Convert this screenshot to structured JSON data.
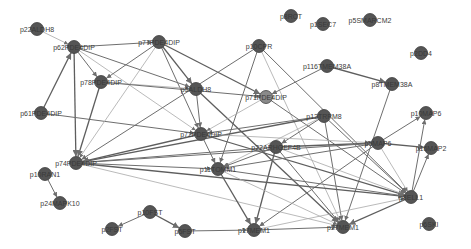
{
  "graph": {
    "type": "protein-interaction-network",
    "node_color": "#555555",
    "edge_color": "#6e6e6e",
    "background": "#ffffff",
    "nodes": [
      {
        "id": "n1",
        "label": "p22ALDH8",
        "x": 37,
        "y": 29
      },
      {
        "id": "n2",
        "label": "p62PDE4DIP",
        "x": 74,
        "y": 47
      },
      {
        "id": "n3",
        "label": "p77PDE4DIP",
        "x": 159,
        "y": 42
      },
      {
        "id": "n4",
        "label": "p10CPR",
        "x": 259,
        "y": 46
      },
      {
        "id": "n5",
        "label": "p8RCT",
        "x": 291,
        "y": 16
      },
      {
        "id": "n6",
        "label": "p1SEC7",
        "x": 323,
        "y": 24
      },
      {
        "id": "n7",
        "label": "p5SMARCM2",
        "x": 370,
        "y": 20
      },
      {
        "id": "n8",
        "label": "p2DD4",
        "x": 421,
        "y": 53
      },
      {
        "id": "n9",
        "label": "p116TMEM38A",
        "x": 327,
        "y": 66
      },
      {
        "id": "n10",
        "label": "p8TMEM38A",
        "x": 392,
        "y": 84
      },
      {
        "id": "n11",
        "label": "p78PDE4DIP",
        "x": 101,
        "y": 82
      },
      {
        "id": "n12",
        "label": "p5ALDH8",
        "x": 196,
        "y": 89
      },
      {
        "id": "n13",
        "label": "p71PDE4DIP",
        "x": 266,
        "y": 97
      },
      {
        "id": "n14",
        "label": "p61PDE4DIP",
        "x": 41,
        "y": 113
      },
      {
        "id": "n15",
        "label": "p12TRPM8",
        "x": 324,
        "y": 116
      },
      {
        "id": "n16",
        "label": "p10MAP6",
        "x": 426,
        "y": 113
      },
      {
        "id": "n17",
        "label": "p72PDE4DIP",
        "x": 201,
        "y": 134
      },
      {
        "id": "n18",
        "label": "p22ARHGEF4B",
        "x": 276,
        "y": 147
      },
      {
        "id": "n19",
        "label": "p5MAP6",
        "x": 378,
        "y": 143
      },
      {
        "id": "n20",
        "label": "p16MAP2",
        "x": 431,
        "y": 148
      },
      {
        "id": "n21",
        "label": "p74PDE4DIP",
        "x": 76,
        "y": 163
      },
      {
        "id": "n22",
        "label": "p10RAN1",
        "x": 45,
        "y": 174
      },
      {
        "id": "n23",
        "label": "p24MAPK10",
        "x": 60,
        "y": 203
      },
      {
        "id": "n24",
        "label": "p11TOMM1",
        "x": 218,
        "y": 169
      },
      {
        "id": "n25",
        "label": "p10FST",
        "x": 150,
        "y": 212
      },
      {
        "id": "n26",
        "label": "p2FST",
        "x": 112,
        "y": 229
      },
      {
        "id": "n27",
        "label": "p5FST",
        "x": 185,
        "y": 231
      },
      {
        "id": "n28",
        "label": "p17MEM1",
        "x": 254,
        "y": 230
      },
      {
        "id": "n29",
        "label": "p27MEM1",
        "x": 343,
        "y": 227
      },
      {
        "id": "n30",
        "label": "p8ELL1",
        "x": 411,
        "y": 197
      },
      {
        "id": "n31",
        "label": "p6SKI",
        "x": 429,
        "y": 224
      }
    ],
    "edges": [
      [
        "n1",
        "n2"
      ],
      [
        "n2",
        "n3"
      ],
      [
        "n2",
        "n11"
      ],
      [
        "n2",
        "n21"
      ],
      [
        "n2",
        "n12"
      ],
      [
        "n2",
        "n17"
      ],
      [
        "n14",
        "n2"
      ],
      [
        "n14",
        "n17"
      ],
      [
        "n3",
        "n11"
      ],
      [
        "n3",
        "n12"
      ],
      [
        "n3",
        "n21"
      ],
      [
        "n3",
        "n17"
      ],
      [
        "n3",
        "n13"
      ],
      [
        "n4",
        "n21"
      ],
      [
        "n4",
        "n24"
      ],
      [
        "n4",
        "n29"
      ],
      [
        "n4",
        "n30"
      ],
      [
        "n9",
        "n13"
      ],
      [
        "n9",
        "n10"
      ],
      [
        "n10",
        "n29"
      ],
      [
        "n11",
        "n12"
      ],
      [
        "n11",
        "n21"
      ],
      [
        "n11",
        "n13"
      ],
      [
        "n12",
        "n17"
      ],
      [
        "n12",
        "n29"
      ],
      [
        "n13",
        "n17"
      ],
      [
        "n13",
        "n30"
      ],
      [
        "n15",
        "n21"
      ],
      [
        "n15",
        "n17"
      ],
      [
        "n15",
        "n18"
      ],
      [
        "n15",
        "n24"
      ],
      [
        "n15",
        "n30"
      ],
      [
        "n15",
        "n29"
      ],
      [
        "n17",
        "n21"
      ],
      [
        "n17",
        "n24"
      ],
      [
        "n17",
        "n19"
      ],
      [
        "n17",
        "n30"
      ],
      [
        "n18",
        "n21"
      ],
      [
        "n18",
        "n24"
      ],
      [
        "n18",
        "n19"
      ],
      [
        "n18",
        "n30"
      ],
      [
        "n18",
        "n29"
      ],
      [
        "n18",
        "n28"
      ],
      [
        "n19",
        "n21"
      ],
      [
        "n19",
        "n16"
      ],
      [
        "n19",
        "n30"
      ],
      [
        "n19",
        "n24"
      ],
      [
        "n19",
        "n28"
      ],
      [
        "n19",
        "n20"
      ],
      [
        "n21",
        "n24"
      ],
      [
        "n21",
        "n29"
      ],
      [
        "n21",
        "n30"
      ],
      [
        "n22",
        "n23"
      ],
      [
        "n24",
        "n30"
      ],
      [
        "n24",
        "n28"
      ],
      [
        "n24",
        "n29"
      ],
      [
        "n25",
        "n26"
      ],
      [
        "n25",
        "n27"
      ],
      [
        "n27",
        "n28"
      ],
      [
        "n28",
        "n29"
      ],
      [
        "n28",
        "n30"
      ],
      [
        "n30",
        "n16"
      ],
      [
        "n30",
        "n20"
      ],
      [
        "n30",
        "n29"
      ]
    ]
  }
}
